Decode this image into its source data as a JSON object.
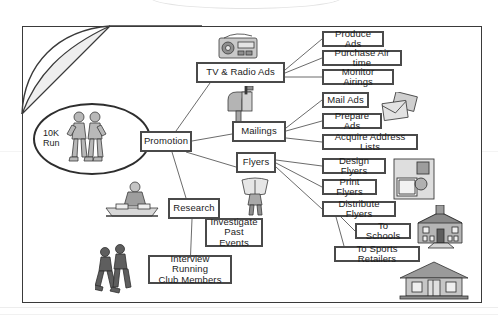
{
  "diagram": {
    "type": "work-breakdown-structure",
    "root": {
      "label": "10K\nRun",
      "shape": "ellipse"
    },
    "nodes": [
      {
        "id": "promotion",
        "label": "Promotion",
        "x": 140,
        "y": 131,
        "w": 52,
        "h": 21
      },
      {
        "id": "tv-radio-ads",
        "label": "TV & Radio Ads",
        "x": 196,
        "y": 62,
        "w": 89,
        "h": 21
      },
      {
        "id": "mailings",
        "label": "Mailings",
        "x": 232,
        "y": 121,
        "w": 54,
        "h": 21
      },
      {
        "id": "flyers",
        "label": "Flyers",
        "x": 236,
        "y": 152,
        "w": 40,
        "h": 21
      },
      {
        "id": "research",
        "label": "Research",
        "x": 168,
        "y": 198,
        "w": 52,
        "h": 21
      },
      {
        "id": "produce-ads",
        "label": "Produce Ads",
        "x": 322,
        "y": 31,
        "w": 62,
        "h": 16
      },
      {
        "id": "purchase-air-time",
        "label": "Purchase Air time",
        "x": 322,
        "y": 50,
        "w": 80,
        "h": 16
      },
      {
        "id": "monitor-airings",
        "label": "Monitor Airings",
        "x": 322,
        "y": 69,
        "w": 72,
        "h": 16
      },
      {
        "id": "mail-ads",
        "label": "Mail Ads",
        "x": 322,
        "y": 92,
        "w": 47,
        "h": 16
      },
      {
        "id": "prepare-ads",
        "label": "Prepare Ads",
        "x": 322,
        "y": 113,
        "w": 60,
        "h": 16
      },
      {
        "id": "acquire-address-lists",
        "label": "Acquire Address Lists",
        "x": 322,
        "y": 134,
        "w": 96,
        "h": 16
      },
      {
        "id": "design-flyers",
        "label": "Design Flyers",
        "x": 322,
        "y": 158,
        "w": 64,
        "h": 16
      },
      {
        "id": "print-flyers",
        "label": "Print Flyers",
        "x": 322,
        "y": 179,
        "w": 55,
        "h": 16
      },
      {
        "id": "distribute-flyers",
        "label": "Distribute Flyers",
        "x": 322,
        "y": 201,
        "w": 74,
        "h": 16
      },
      {
        "id": "to-schools",
        "label": "To Schools",
        "x": 355,
        "y": 223,
        "w": 56,
        "h": 16
      },
      {
        "id": "to-sports-retailers",
        "label": "To Sports Retailers",
        "x": 334,
        "y": 246,
        "w": 86,
        "h": 16
      },
      {
        "id": "investigate-past-events",
        "label": "Investigate\nPast Events",
        "x": 205,
        "y": 218,
        "w": 58,
        "h": 29
      },
      {
        "id": "interview-running-club-members",
        "label": "Interview Running\nClub Members",
        "x": 148,
        "y": 255,
        "w": 84,
        "h": 29
      }
    ],
    "edges": [
      {
        "from": "root",
        "to": "promotion"
      },
      {
        "from": "promotion",
        "to": "tv-radio-ads"
      },
      {
        "from": "promotion",
        "to": "mailings"
      },
      {
        "from": "promotion",
        "to": "flyers"
      },
      {
        "from": "promotion",
        "to": "research"
      },
      {
        "from": "tv-radio-ads",
        "to": "produce-ads"
      },
      {
        "from": "tv-radio-ads",
        "to": "purchase-air-time"
      },
      {
        "from": "tv-radio-ads",
        "to": "monitor-airings"
      },
      {
        "from": "mailings",
        "to": "mail-ads"
      },
      {
        "from": "mailings",
        "to": "prepare-ads"
      },
      {
        "from": "mailings",
        "to": "acquire-address-lists"
      },
      {
        "from": "flyers",
        "to": "design-flyers"
      },
      {
        "from": "flyers",
        "to": "print-flyers"
      },
      {
        "from": "flyers",
        "to": "distribute-flyers"
      },
      {
        "from": "distribute-flyers",
        "to": "to-schools"
      },
      {
        "from": "distribute-flyers",
        "to": "to-sports-retailers"
      },
      {
        "from": "research",
        "to": "investigate-past-events"
      },
      {
        "from": "research",
        "to": "interview-running-club-members"
      }
    ],
    "clipart": [
      {
        "id": "boombox",
        "name": "radio-boombox-clipart",
        "x": 216,
        "y": 30,
        "w": 44,
        "h": 32
      },
      {
        "id": "mailbox",
        "name": "mailbox-clipart",
        "x": 220,
        "y": 86,
        "w": 38,
        "h": 36
      },
      {
        "id": "envelopes",
        "name": "envelopes-clipart",
        "x": 380,
        "y": 92,
        "w": 40,
        "h": 34
      },
      {
        "id": "person-reading-flyer",
        "name": "person-holding-flyer-clipart",
        "x": 240,
        "y": 176,
        "w": 30,
        "h": 40
      },
      {
        "id": "person-at-desk",
        "name": "person-researching-clipart",
        "x": 104,
        "y": 178,
        "w": 56,
        "h": 44
      },
      {
        "id": "printing-press",
        "name": "print-shop-photo",
        "x": 393,
        "y": 158,
        "w": 42,
        "h": 42
      },
      {
        "id": "runners-pair",
        "name": "two-runners-clipart",
        "x": 95,
        "y": 243,
        "w": 40,
        "h": 52
      },
      {
        "id": "school-building",
        "name": "school-building-clipart",
        "x": 414,
        "y": 205,
        "w": 54,
        "h": 44
      },
      {
        "id": "retail-store",
        "name": "retail-store-clipart",
        "x": 398,
        "y": 258,
        "w": 72,
        "h": 42
      },
      {
        "id": "root-runners",
        "name": "two-runners-ellipse-clipart",
        "x": 63,
        "y": 108,
        "w": 50,
        "h": 60
      }
    ],
    "colors": {
      "frame_border": "#3a3a3a",
      "node_border": "#4a4a4a",
      "node_fill": "#ffffff",
      "text": "#1c1c1c",
      "link": "#5a5a5a",
      "clipart_gray": "#9a9a9a"
    }
  }
}
